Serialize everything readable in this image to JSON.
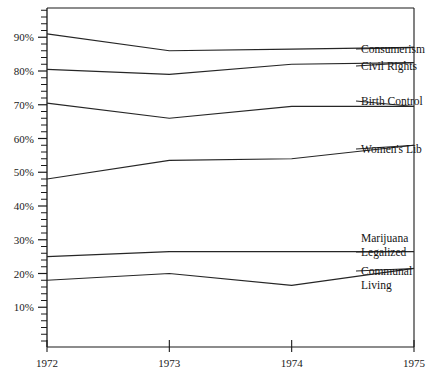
{
  "chart_data": {
    "type": "line",
    "title": "",
    "subtitle": "",
    "xlabel": "",
    "ylabel": "",
    "categories": [
      "1972",
      "1973",
      "1974",
      "1975"
    ],
    "x": [
      1972,
      1973,
      1974,
      1975
    ],
    "xlim": [
      1972,
      1975
    ],
    "ylim": [
      0,
      100
    ],
    "grid": false,
    "legend_position": "right-inline-labels",
    "y_tick_labels": [
      "10%",
      "20%",
      "30%",
      "40%",
      "50%",
      "60%",
      "70%",
      "80%",
      "90%"
    ],
    "y_tick_values": [
      10,
      20,
      30,
      40,
      50,
      60,
      70,
      80,
      90
    ],
    "y_minor_tick_step": 2,
    "series": [
      {
        "name": "Consumerism",
        "values": [
          91,
          86,
          86.5,
          87
        ]
      },
      {
        "name": "Civil Rights",
        "values": [
          80.5,
          79,
          82,
          82.5
        ]
      },
      {
        "name": "Birth Control",
        "values": [
          70.5,
          66,
          69.5,
          69.5
        ]
      },
      {
        "name": "Women's Lib",
        "values": [
          48,
          53.5,
          54,
          58
        ]
      },
      {
        "name": "Marijuana Legalized",
        "values": [
          25,
          26.5,
          26.5,
          26.5
        ]
      },
      {
        "name": "Communal Living",
        "values": [
          18,
          20,
          16.5,
          21.5
        ]
      }
    ]
  },
  "labels": {
    "consumerism": "Consumerism",
    "civil_rights": "Civil Rights",
    "birth_control": "Birth Control",
    "womens_lib": "Women's Lib",
    "marijuana_line1": "Marijuana",
    "marijuana_line2": "Legalized",
    "communal_line1": "Communal",
    "communal_line2": "Living"
  },
  "axis": {
    "y_ticks": [
      "90%",
      "80%",
      "70%",
      "60%",
      "50%",
      "40%",
      "30%",
      "20%",
      "10%"
    ],
    "x_ticks": [
      "1972",
      "1973",
      "1974",
      "1975"
    ]
  },
  "colors": {
    "line": "#262626",
    "axis": "#1a1a1a",
    "background": "#ffffff",
    "text": "#141414"
  }
}
